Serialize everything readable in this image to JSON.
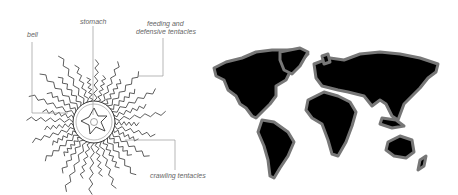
{
  "figure": {
    "jellyfish": {
      "labels": {
        "bell": "bell",
        "stomach": "stomach",
        "feeding_line1": "feeding and",
        "feeding_line2": "defensive tentacles",
        "crawling": "crawling tentacles"
      }
    },
    "map": {
      "subject": "world map"
    }
  }
}
